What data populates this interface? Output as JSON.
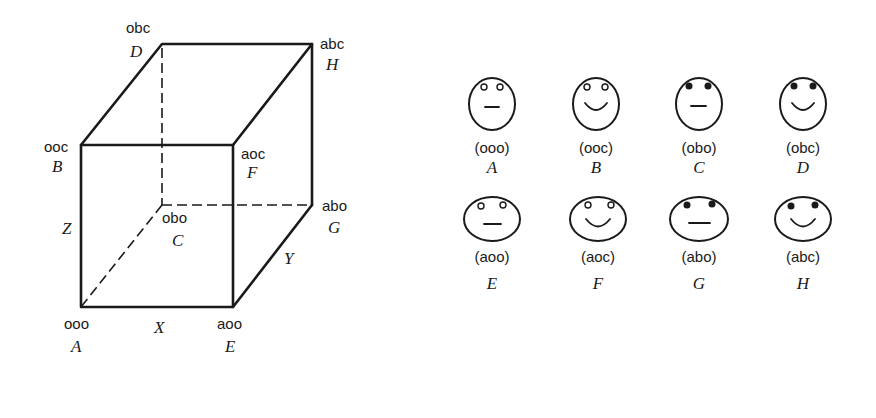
{
  "cube": {
    "vertices": [
      {
        "id": "A",
        "code": "ooo",
        "x": 81,
        "y": 307
      },
      {
        "id": "B",
        "code": "ooc",
        "x": 81,
        "y": 145
      },
      {
        "id": "C",
        "code": "obo",
        "x": 162,
        "y": 205
      },
      {
        "id": "D",
        "code": "obc",
        "x": 162,
        "y": 44
      },
      {
        "id": "E",
        "code": "aoo",
        "x": 233,
        "y": 307
      },
      {
        "id": "F",
        "code": "aoc",
        "x": 233,
        "y": 145
      },
      {
        "id": "G",
        "code": "abo",
        "x": 312,
        "y": 205
      },
      {
        "id": "H",
        "code": "abc",
        "x": 312,
        "y": 44
      }
    ],
    "axes": {
      "x": "X",
      "y": "Y",
      "z": "Z"
    }
  },
  "faces": [
    {
      "id": "A",
      "code": "(ooo)",
      "shape": "tall",
      "eyes": "open",
      "mouth": "flat"
    },
    {
      "id": "B",
      "code": "(ooc)",
      "shape": "tall",
      "eyes": "open",
      "mouth": "smile"
    },
    {
      "id": "C",
      "code": "(obo)",
      "shape": "tall",
      "eyes": "filled",
      "mouth": "flat"
    },
    {
      "id": "D",
      "code": "(obc)",
      "shape": "tall",
      "eyes": "filled",
      "mouth": "smile"
    },
    {
      "id": "E",
      "code": "(aoo)",
      "shape": "wide",
      "eyes": "open",
      "mouth": "flat"
    },
    {
      "id": "F",
      "code": "(aoc)",
      "shape": "wide",
      "eyes": "open",
      "mouth": "smile"
    },
    {
      "id": "G",
      "code": "(abo)",
      "shape": "wide",
      "eyes": "filled",
      "mouth": "flat"
    },
    {
      "id": "H",
      "code": "(abc)",
      "shape": "wide",
      "eyes": "filled",
      "mouth": "smile"
    }
  ]
}
